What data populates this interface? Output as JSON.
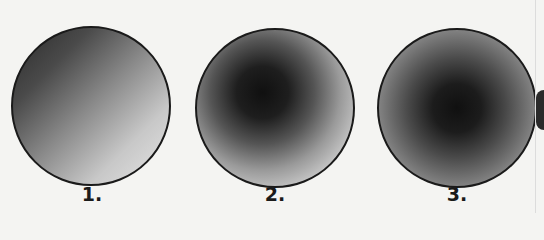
{
  "figure": {
    "items": [
      {
        "label": "1.",
        "shading": "linear gradient, dark upper-left to light lower-right"
      },
      {
        "label": "2.",
        "shading": "radial gradient, dark center slightly upper-left, light rim"
      },
      {
        "label": "3.",
        "shading": "radial gradient, dark center, mid-gray rim"
      }
    ]
  }
}
